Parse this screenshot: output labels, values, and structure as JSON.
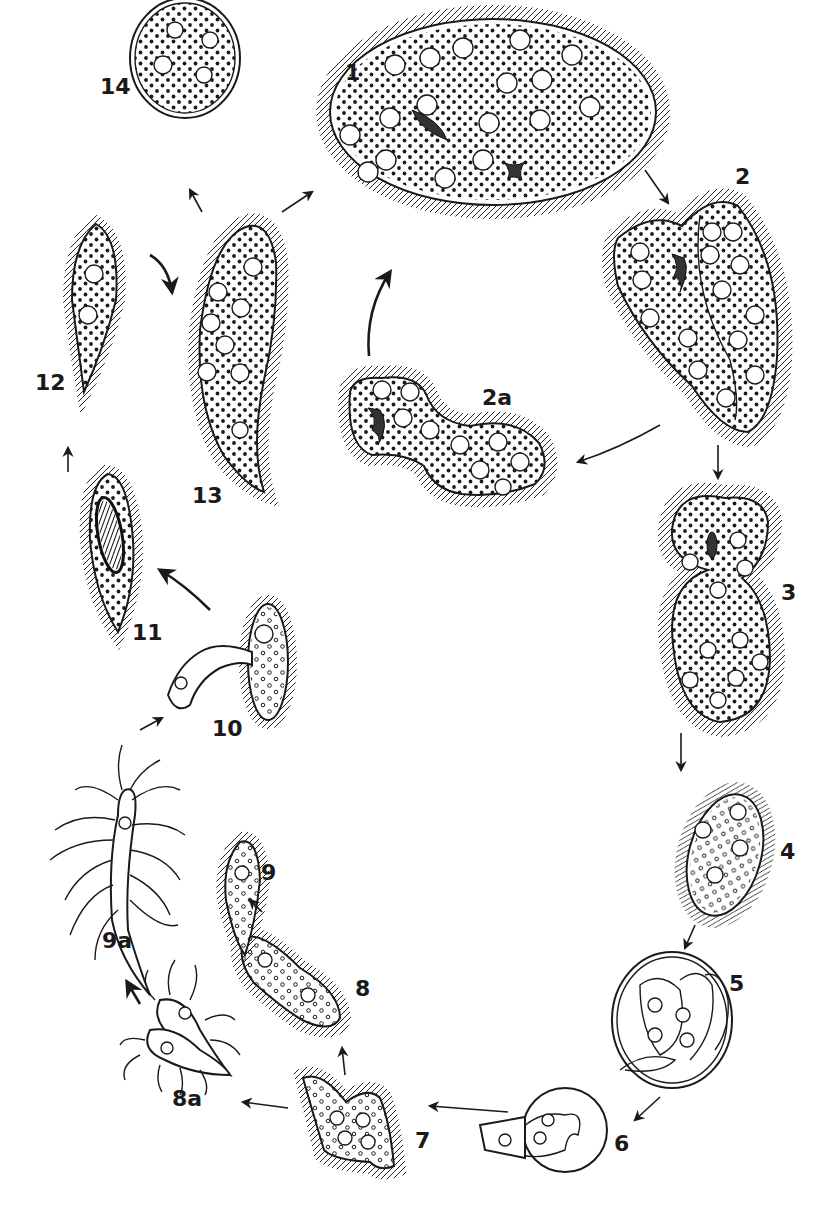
{
  "diagram": {
    "type": "life-cycle",
    "style": "black-and-white line drawing",
    "background": "#ffffff",
    "ink_color": "#1a1a1a"
  },
  "stages": [
    {
      "id": "1",
      "label": "1",
      "shape": "large ciliated oval cell with many nuclei and dividing spindles"
    },
    {
      "id": "2",
      "label": "2",
      "shape": "irregular ciliated cell beginning to divide"
    },
    {
      "id": "2a",
      "label": "2a",
      "shape": "two-lobed ciliated cell dividing"
    },
    {
      "id": "3",
      "label": "3",
      "shape": "constricted figure-eight ciliated cell"
    },
    {
      "id": "4",
      "label": "4",
      "shape": "oval ciliated cell"
    },
    {
      "id": "5",
      "label": "5",
      "shape": "encysted cell containing folded bodies"
    },
    {
      "id": "6",
      "label": "6",
      "shape": "cell emerging from cyst"
    },
    {
      "id": "7",
      "label": "7",
      "shape": "branching ciliated cell"
    },
    {
      "id": "8",
      "label": "8",
      "shape": "elongated ciliated cell"
    },
    {
      "id": "8a",
      "label": "8a",
      "shape": "pair of cells with long flagella-like processes"
    },
    {
      "id": "9",
      "label": "9",
      "shape": "tapered ciliated cell"
    },
    {
      "id": "9a",
      "label": "9a",
      "shape": "elongate cell with many long wavy processes"
    },
    {
      "id": "10",
      "label": "10",
      "shape": "budding cell with attached small cell"
    },
    {
      "id": "11",
      "label": "11",
      "shape": "tapered cell with large dark spindle"
    },
    {
      "id": "12",
      "label": "12",
      "shape": "tapered ciliated cell"
    },
    {
      "id": "13",
      "label": "13",
      "shape": "elongated curved ciliated cell"
    },
    {
      "id": "14",
      "label": "14",
      "shape": "round encysted cell with double wall"
    }
  ],
  "transitions": [
    {
      "from": "13",
      "to": "1"
    },
    {
      "from": "1",
      "to": "2"
    },
    {
      "from": "2",
      "to": "3"
    },
    {
      "from": "2",
      "to": "2a"
    },
    {
      "from": "2a",
      "to": "1"
    },
    {
      "from": "3",
      "to": "4"
    },
    {
      "from": "4",
      "to": "5"
    },
    {
      "from": "5",
      "to": "6"
    },
    {
      "from": "6",
      "to": "7"
    },
    {
      "from": "7",
      "to": "8"
    },
    {
      "from": "7",
      "to": "8a"
    },
    {
      "from": "8",
      "to": "9"
    },
    {
      "from": "8a",
      "to": "9a"
    },
    {
      "from": "9a",
      "to": "10"
    },
    {
      "from": "10",
      "to": "11"
    },
    {
      "from": "11",
      "to": "12"
    },
    {
      "from": "12",
      "to": "13"
    },
    {
      "from": "13",
      "to": "14"
    }
  ]
}
